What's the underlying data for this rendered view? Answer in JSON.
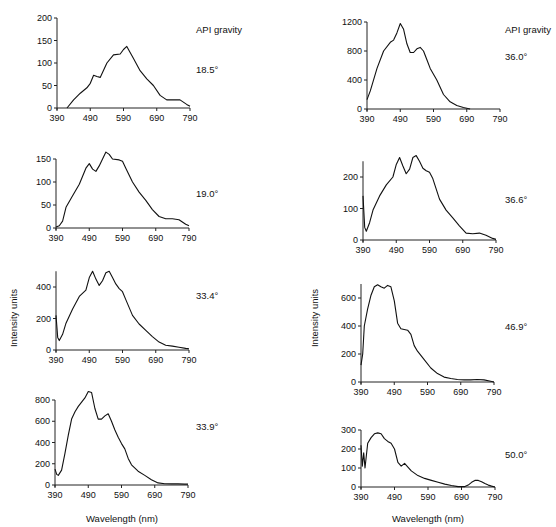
{
  "figure": {
    "ylabel": "Intensity units",
    "xlabel": "Wavelength (nm)",
    "legend_title": "API gravity"
  },
  "chart_data": [
    {
      "type": "line",
      "title": "18.5°",
      "xlabel": "",
      "ylabel": "Intensity units",
      "xlim": [
        390,
        790
      ],
      "ylim": [
        0,
        200
      ],
      "xticks": [
        390,
        490,
        590,
        690,
        790
      ],
      "yticks": [
        0,
        50,
        100,
        150,
        200
      ],
      "x": [
        420,
        440,
        460,
        480,
        490,
        500,
        510,
        520,
        540,
        560,
        580,
        590,
        600,
        620,
        640,
        660,
        680,
        700,
        720,
        740,
        760,
        780,
        790
      ],
      "y": [
        0,
        18,
        33,
        45,
        55,
        73,
        70,
        68,
        100,
        118,
        120,
        130,
        137,
        110,
        83,
        65,
        50,
        28,
        18,
        18,
        18,
        8,
        4
      ]
    },
    {
      "type": "line",
      "title": "19.0°",
      "xlabel": "",
      "ylabel": "Intensity units",
      "xlim": [
        390,
        790
      ],
      "ylim": [
        0,
        150
      ],
      "xticks": [
        390,
        490,
        590,
        690,
        790
      ],
      "yticks": [
        0,
        50,
        100,
        150
      ],
      "x": [
        390,
        400,
        410,
        420,
        440,
        460,
        480,
        490,
        500,
        510,
        520,
        540,
        550,
        560,
        580,
        590,
        600,
        620,
        640,
        660,
        680,
        700,
        720,
        740,
        760,
        780,
        790
      ],
      "y": [
        2,
        5,
        15,
        45,
        70,
        95,
        130,
        140,
        128,
        123,
        135,
        165,
        160,
        150,
        148,
        145,
        130,
        100,
        78,
        60,
        40,
        25,
        20,
        20,
        18,
        8,
        5
      ]
    },
    {
      "type": "line",
      "title": "33.4°",
      "xlabel": "",
      "ylabel": "Intensity units",
      "xlim": [
        390,
        790
      ],
      "ylim": [
        0,
        500
      ],
      "xticks": [
        390,
        490,
        590,
        690,
        790
      ],
      "yticks": [
        0,
        200,
        400
      ],
      "x": [
        390,
        395,
        400,
        410,
        420,
        440,
        460,
        480,
        490,
        500,
        510,
        520,
        530,
        540,
        550,
        560,
        570,
        580,
        590,
        600,
        620,
        640,
        660,
        680,
        700,
        720,
        740,
        760,
        780,
        790
      ],
      "y": [
        220,
        80,
        60,
        100,
        170,
        260,
        340,
        380,
        460,
        500,
        450,
        410,
        440,
        490,
        500,
        460,
        420,
        390,
        370,
        320,
        220,
        165,
        125,
        85,
        50,
        30,
        25,
        18,
        10,
        8
      ]
    },
    {
      "type": "line",
      "title": "33.9°",
      "xlabel": "Wavelength (nm)",
      "ylabel": "Intensity units",
      "xlim": [
        390,
        790
      ],
      "ylim": [
        0,
        800
      ],
      "xticks": [
        390,
        490,
        590,
        690,
        790
      ],
      "yticks": [
        0,
        200,
        400,
        600,
        800
      ],
      "x": [
        390,
        395,
        400,
        410,
        420,
        430,
        440,
        450,
        460,
        470,
        480,
        490,
        500,
        510,
        520,
        530,
        540,
        550,
        560,
        570,
        580,
        590,
        600,
        610,
        620,
        640,
        660,
        680,
        700,
        720,
        740,
        760,
        780,
        790
      ],
      "y": [
        150,
        100,
        90,
        140,
        300,
        470,
        620,
        690,
        740,
        780,
        820,
        880,
        870,
        720,
        620,
        620,
        650,
        670,
        600,
        520,
        450,
        390,
        340,
        250,
        190,
        130,
        90,
        50,
        20,
        12,
        10,
        10,
        8,
        8
      ]
    },
    {
      "type": "line",
      "title": "36.0°",
      "xlabel": "",
      "ylabel": "Intensity units",
      "xlim": [
        390,
        790
      ],
      "ylim": [
        0,
        1200
      ],
      "xticks": [
        390,
        490,
        590,
        690,
        790
      ],
      "yticks": [
        0,
        400,
        800,
        1200
      ],
      "x": [
        390,
        400,
        420,
        440,
        460,
        470,
        480,
        490,
        500,
        510,
        520,
        530,
        540,
        550,
        560,
        570,
        580,
        590,
        600,
        620,
        640,
        660,
        680,
        700
      ],
      "y": [
        130,
        250,
        560,
        800,
        920,
        950,
        1050,
        1180,
        1100,
        900,
        780,
        780,
        830,
        850,
        800,
        680,
        560,
        480,
        400,
        200,
        100,
        50,
        20,
        0
      ]
    },
    {
      "type": "line",
      "title": "36.6°",
      "xlabel": "",
      "ylabel": "Intensity units",
      "xlim": [
        390,
        790
      ],
      "ylim": [
        0,
        250
      ],
      "xticks": [
        390,
        490,
        590,
        690,
        790
      ],
      "yticks": [
        0,
        100,
        200
      ],
      "x": [
        390,
        395,
        400,
        410,
        420,
        440,
        460,
        480,
        490,
        500,
        510,
        520,
        530,
        540,
        550,
        560,
        570,
        580,
        590,
        600,
        620,
        640,
        660,
        680,
        700,
        720,
        740,
        760,
        780,
        790
      ],
      "y": [
        140,
        40,
        28,
        55,
        95,
        140,
        175,
        200,
        240,
        262,
        235,
        210,
        225,
        262,
        268,
        250,
        228,
        220,
        215,
        195,
        130,
        95,
        70,
        45,
        22,
        20,
        22,
        15,
        5,
        2
      ]
    },
    {
      "type": "line",
      "title": "46.9°",
      "xlabel": "",
      "ylabel": "Intensity units",
      "xlim": [
        390,
        790
      ],
      "ylim": [
        0,
        700
      ],
      "xticks": [
        390,
        490,
        590,
        690,
        790
      ],
      "yticks": [
        0,
        200,
        400,
        600
      ],
      "x": [
        390,
        395,
        400,
        410,
        420,
        430,
        440,
        450,
        460,
        470,
        480,
        490,
        500,
        510,
        520,
        530,
        540,
        550,
        560,
        580,
        600,
        620,
        640,
        660,
        680,
        700,
        720,
        740,
        760,
        780,
        790
      ],
      "y": [
        120,
        200,
        400,
        520,
        620,
        680,
        695,
        680,
        670,
        690,
        680,
        580,
        420,
        380,
        375,
        370,
        340,
        260,
        220,
        160,
        100,
        60,
        35,
        25,
        18,
        15,
        15,
        18,
        15,
        5,
        0
      ]
    },
    {
      "type": "line",
      "title": "50.0°",
      "xlabel": "Wavelength (nm)",
      "ylabel": "Intensity units",
      "xlim": [
        390,
        790
      ],
      "ylim": [
        0,
        300
      ],
      "xticks": [
        390,
        490,
        590,
        690,
        790
      ],
      "yticks": [
        0,
        100,
        200,
        300
      ],
      "x": [
        390,
        394,
        398,
        402,
        410,
        420,
        430,
        440,
        450,
        460,
        470,
        480,
        490,
        500,
        510,
        520,
        530,
        540,
        560,
        580,
        600,
        620,
        640,
        660,
        680,
        700,
        710,
        720,
        730,
        740,
        750,
        760,
        770,
        780,
        790
      ],
      "y": [
        220,
        110,
        180,
        100,
        230,
        260,
        280,
        285,
        280,
        255,
        240,
        230,
        200,
        130,
        110,
        125,
        105,
        85,
        60,
        45,
        35,
        25,
        15,
        8,
        2,
        2,
        10,
        25,
        35,
        35,
        28,
        18,
        10,
        5,
        0
      ]
    }
  ],
  "panels": [
    {
      "label": "18.5°",
      "ox": 57,
      "oy": 108,
      "w": 133,
      "h": 90,
      "ymax": 200,
      "yticks": [
        0,
        50,
        100,
        150,
        200
      ],
      "gx": 196,
      "gy": 73,
      "showTop": true
    },
    {
      "label": "19.0°",
      "ox": 56,
      "oy": 228,
      "w": 133,
      "h": 69,
      "ymax": 150,
      "yticks": [
        0,
        50,
        100,
        150
      ],
      "gx": 196,
      "gy": 197
    },
    {
      "label": "33.4°",
      "ox": 56,
      "oy": 350,
      "w": 133,
      "h": 78,
      "ymax": 500,
      "yticks": [
        0,
        200,
        400
      ],
      "gx": 196,
      "gy": 299,
      "scaleH": 63,
      "scaleVal": 400
    },
    {
      "label": "33.9°",
      "ox": 55,
      "oy": 485,
      "w": 133,
      "h": 85,
      "ymax": 800,
      "yticks": [
        0,
        200,
        400,
        600,
        800
      ],
      "gx": 196,
      "gy": 430,
      "xlabel": true
    },
    {
      "label": "36.0°",
      "ox": 367,
      "oy": 109,
      "w": 133,
      "h": 87,
      "ymax": 1200,
      "yticks": [
        0,
        400,
        800,
        1200
      ],
      "gx": 505,
      "gy": 60
    },
    {
      "label": "36.6°",
      "ox": 363,
      "oy": 240,
      "w": 133,
      "h": 78,
      "ymax": 250,
      "yticks": [
        0,
        100,
        200
      ],
      "gx": 505,
      "gy": 203,
      "scaleH": 63,
      "scaleVal": 200
    },
    {
      "label": "46.9°",
      "ox": 361,
      "oy": 382,
      "w": 133,
      "h": 98,
      "ymax": 700,
      "yticks": [
        0,
        200,
        400,
        600
      ],
      "gx": 505,
      "gy": 330,
      "scaleH": 84,
      "scaleVal": 600
    },
    {
      "label": "50.0°",
      "ox": 361,
      "oy": 487,
      "w": 134,
      "h": 57,
      "ymax": 300,
      "yticks": [
        0,
        100,
        200,
        300
      ],
      "gx": 505,
      "gy": 458,
      "xlabel": true
    }
  ]
}
